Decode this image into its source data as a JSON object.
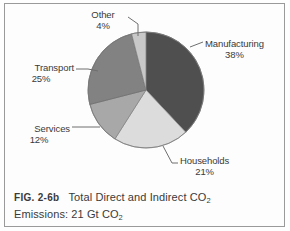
{
  "figure": {
    "caption_number": "FIG. 2-6b",
    "caption_line1_pre": "Total Direct and Indirect CO",
    "caption_line1_sub": "2",
    "caption_line2_pre": "Emissions: 21 Gt CO",
    "caption_line2_sub": "2",
    "border_color": "#9a9a9a",
    "background": "#fdfdfd"
  },
  "chart_data": {
    "type": "pie",
    "title": "Total Direct and Indirect CO2 Emissions: 21 Gt CO2",
    "unit": "percent",
    "total_label": "21 Gt CO2",
    "categories": [
      "Manufacturing",
      "Households",
      "Services",
      "Transport",
      "Other"
    ],
    "values": [
      38,
      21,
      12,
      25,
      4
    ],
    "colors": [
      "#4f4f4f",
      "#dcdcdc",
      "#a8a8a8",
      "#828282",
      "#c8c8c8"
    ],
    "start_angle_deg": 0,
    "direction": "clockwise",
    "legend": "labels-with-leader-lines",
    "grid": false,
    "slices": [
      {
        "label": "Manufacturing",
        "percent_text": "38%",
        "value": 38,
        "color": "#4f4f4f"
      },
      {
        "label": "Households",
        "percent_text": "21%",
        "value": 21,
        "color": "#dcdcdc"
      },
      {
        "label": "Services",
        "percent_text": "12%",
        "value": 12,
        "color": "#a8a8a8"
      },
      {
        "label": "Transport",
        "percent_text": "25%",
        "value": 25,
        "color": "#828282"
      },
      {
        "label": "Other",
        "percent_text": "4%",
        "value": 4,
        "color": "#c8c8c8"
      }
    ]
  }
}
